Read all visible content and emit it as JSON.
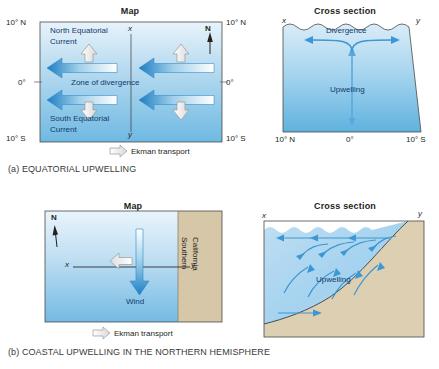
{
  "figure": {
    "panels": [
      {
        "id": "a",
        "caption": "(a) EQUATORIAL UPWELLING",
        "map": {
          "title": "Map",
          "axis_left": [
            "10° N",
            "0°",
            "10° S"
          ],
          "axis_right": [
            "10° N",
            "0°",
            "10° S"
          ],
          "compass": "N",
          "x_marker": "x",
          "y_marker": "y",
          "labels": {
            "north_current": "North Equatorial\nCurrent",
            "north_current_line1": "North Equatorial",
            "north_current_line2": "Current",
            "south_current_line1": "South Equatorial",
            "south_current_line2": "Current",
            "zone": "Zone of divergence"
          },
          "legend": "Ekman transport"
        },
        "cross": {
          "title": "Cross section",
          "x_marker": "x",
          "y_marker": "y",
          "labels": {
            "divergence": "Divergence",
            "upwelling": "Upwelling"
          },
          "axis_bottom": [
            "10° N",
            "0°",
            "10° S"
          ]
        }
      },
      {
        "id": "b",
        "caption": "(b) COASTAL UPWELLING IN THE NORTHERN HEMISPHERE",
        "map": {
          "title": "Map",
          "compass": "N",
          "x_marker": "x",
          "y_marker": "y",
          "labels": {
            "wind": "Wind",
            "land_line1": "Southern",
            "land_line2": "California"
          },
          "legend": "Ekman transport"
        },
        "cross": {
          "title": "Cross section",
          "x_marker": "x",
          "y_marker": "y",
          "labels": {
            "upwelling": "Upwelling"
          }
        }
      }
    ]
  },
  "colors": {
    "ocean_light": "#eaf4fb",
    "ocean_mid": "#9ecdea",
    "ocean_deep": "#5fb0dd",
    "current_blue": "#2a86c8",
    "arrow_blue": "#1f7fc4",
    "land_tan": "#d6c7a8",
    "frame": "#4a4a4a",
    "text": "#231f20",
    "label_blue": "#123a6b"
  }
}
